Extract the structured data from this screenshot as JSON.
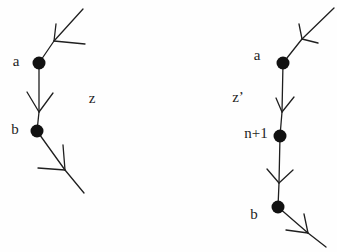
{
  "diagram": {
    "canvas": {
      "width": 337,
      "height": 252,
      "background": "#fefefe"
    },
    "style": {
      "ink": "#1f1f1f",
      "node_fill": "#111111",
      "stroke_width": 1.3
    },
    "trees": [
      {
        "id": "left",
        "path_label": {
          "text": "z",
          "x": 92,
          "y": 103
        },
        "nodes": [
          {
            "id": "a",
            "label": "a",
            "label_x": 16,
            "label_y": 66,
            "cx": 39,
            "cy": 63,
            "r": 6.5
          },
          {
            "id": "b",
            "label": "b",
            "label_x": 15,
            "label_y": 134,
            "cx": 37,
            "cy": 131,
            "r": 6.5
          }
        ],
        "edges": [
          {
            "from": [
              83,
              9
            ],
            "to": [
              39,
              63
            ],
            "fork": [
              54,
              41
            ],
            "barbs": [
              [
                56,
                24
              ],
              [
                85,
                44
              ]
            ]
          },
          {
            "from": [
              39,
              63
            ],
            "to": [
              37,
              131
            ],
            "fork": [
              39,
              112
            ],
            "barbs": [
              [
                27,
                92
              ],
              [
                53,
                93
              ]
            ]
          },
          {
            "from": [
              37,
              131
            ],
            "to": [
              84,
              193
            ],
            "fork": [
              65,
              170
            ],
            "barbs": [
              [
                63,
                145
              ],
              [
                38,
                168
              ]
            ]
          }
        ]
      },
      {
        "id": "right",
        "path_label": {
          "text": "z’",
          "x": 238,
          "y": 102
        },
        "nodes": [
          {
            "id": "a",
            "label": "a",
            "label_x": 257,
            "label_y": 60,
            "cx": 283,
            "cy": 63,
            "r": 6.5
          },
          {
            "id": "n+1",
            "label": "n+1",
            "label_x": 256,
            "label_y": 138,
            "cx": 280,
            "cy": 136,
            "r": 6.5
          },
          {
            "id": "b",
            "label": "b",
            "label_x": 254,
            "label_y": 219,
            "cx": 278,
            "cy": 207,
            "r": 6.5
          }
        ],
        "edges": [
          {
            "from": [
              334,
              8
            ],
            "to": [
              283,
              63
            ],
            "fork": [
              302,
              39
            ],
            "barbs": [
              [
                299,
                24
              ],
              [
                318,
                43
              ]
            ]
          },
          {
            "from": [
              283,
              63
            ],
            "to": [
              280,
              136
            ],
            "fork": [
              282,
              112
            ],
            "barbs": [
              [
                276,
                98
              ],
              [
                294,
                97
              ]
            ]
          },
          {
            "from": [
              280,
              136
            ],
            "to": [
              278,
              207
            ],
            "fork": [
              279,
              183
            ],
            "barbs": [
              [
                267,
                169
              ],
              [
                293,
                170
              ]
            ]
          },
          {
            "from": [
              278,
              207
            ],
            "to": [
              326,
              247
            ],
            "fork": [
              308,
              233
            ],
            "barbs": [
              [
                304,
                214
              ],
              [
                286,
                230
              ]
            ]
          }
        ]
      }
    ]
  }
}
